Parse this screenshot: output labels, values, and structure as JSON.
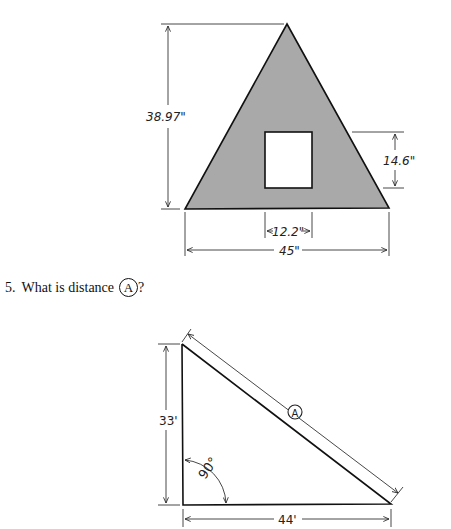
{
  "figure1": {
    "shape": "triangle with rectangular cutout",
    "fill_color": "#a9a9a9",
    "height_label": "38.97\"",
    "base_label": "45\"",
    "cutout_width_label": "12.2\"",
    "cutout_height_label": "14.6\""
  },
  "question": {
    "number": "5.",
    "text": "What is distance",
    "marker": "A",
    "suffix": "?"
  },
  "figure2": {
    "shape": "right triangle",
    "height_label": "33'",
    "base_label": "44'",
    "angle_label": "90°",
    "hypotenuse_marker": "A"
  }
}
